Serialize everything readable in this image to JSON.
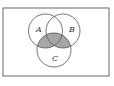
{
  "diagram": {
    "type": "venn",
    "sets": [
      {
        "name": "A",
        "label": "A"
      },
      {
        "name": "B",
        "label": "B"
      },
      {
        "name": "C",
        "label": "C"
      }
    ],
    "shaded_region": "(A ∩ C) ∪ (B ∩ C)",
    "colors": {
      "shade": "#a6a6a6",
      "stroke": "#555555",
      "background": "#ffffff"
    }
  }
}
